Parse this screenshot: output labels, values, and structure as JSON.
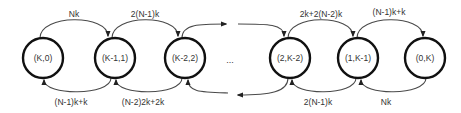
{
  "diagram": {
    "type": "state-transition-chain",
    "nodes": [
      {
        "id": "n0",
        "label": "(K,0)"
      },
      {
        "id": "n1",
        "label": "(K-1,1)"
      },
      {
        "id": "n2",
        "label": "(K-2,2)"
      },
      {
        "id": "n3",
        "label": "(2,K-2)"
      },
      {
        "id": "n4",
        "label": "(1,K-1)"
      },
      {
        "id": "n5",
        "label": "(0,K)"
      }
    ],
    "ellipsis": "...",
    "forward_edges": [
      {
        "from": "(K,0)",
        "to": "(K-1,1)",
        "label": "Nk"
      },
      {
        "from": "(K-1,1)",
        "to": "(K-2,2)",
        "label": "2(N-1)k"
      },
      {
        "from": "(2,K-2)",
        "to": "(1,K-1)",
        "label": "2k+2(N-2)k"
      },
      {
        "from": "(1,K-1)",
        "to": "(0,K)",
        "label": "(N-1)k+k"
      }
    ],
    "backward_edges": [
      {
        "from": "(K-1,1)",
        "to": "(K,0)",
        "label": "(N-1)k+k"
      },
      {
        "from": "(K-2,2)",
        "to": "(K-1,1)",
        "label": "(N-2)2k+2k"
      },
      {
        "from": "(1,K-1)",
        "to": "(2,K-2)",
        "label": "2(N-1)k"
      },
      {
        "from": "(0,K)",
        "to": "(1,K-1)",
        "label": "Nk"
      }
    ],
    "colors": {
      "node_stroke": "#111111",
      "edge_stroke": "#4a4a4a",
      "text": "#333333",
      "background": "#ffffff"
    }
  }
}
